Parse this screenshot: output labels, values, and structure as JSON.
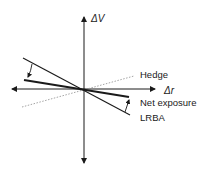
{
  "diagram": {
    "type": "vector-diagram",
    "axes": {
      "x": {
        "label": "Δr"
      },
      "y": {
        "label": "ΔV"
      }
    },
    "lines": [
      {
        "name": "Hedge",
        "style": "dotted",
        "slope_sign": "positive"
      },
      {
        "name": "Net exposure",
        "style": "thick",
        "slope_sign": "negative-shallow"
      },
      {
        "name": "LRBA",
        "style": "thin",
        "slope_sign": "negative-steep"
      }
    ],
    "annotations": [
      {
        "type": "curved-arrow",
        "from": "LRBA",
        "to": "Net exposure",
        "side": "left"
      },
      {
        "type": "curved-arrow",
        "from": "LRBA",
        "to": "Net exposure",
        "side": "right"
      }
    ],
    "colors": {
      "ink": "#1a1a1a",
      "dotted": "#9a9a9a"
    }
  },
  "labels": {
    "y_axis": "ΔV",
    "x_axis": "Δr",
    "hedge": "Hedge",
    "net_exposure": "Net exposure",
    "lrba": "LRBA"
  }
}
